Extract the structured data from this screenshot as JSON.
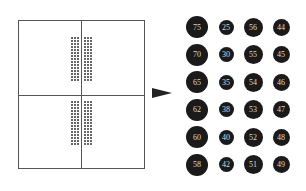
{
  "grid": {
    "quadrants": 4,
    "dot_columns_per_side": 3,
    "dot_rows_per_quadrant": 15
  },
  "arrow": {
    "direction": "right",
    "color": "#222222"
  },
  "circles": {
    "color": "#1a1a1a",
    "text_color": "#d8d8d8",
    "rows": [
      [
        "75",
        "25",
        "56",
        "44"
      ],
      [
        "70",
        "30",
        "55",
        "45"
      ],
      [
        "65",
        "35",
        "54",
        "46"
      ],
      [
        "62",
        "38",
        "53",
        "47"
      ],
      [
        "60",
        "40",
        "52",
        "48"
      ],
      [
        "58",
        "42",
        "51",
        "49"
      ]
    ]
  }
}
